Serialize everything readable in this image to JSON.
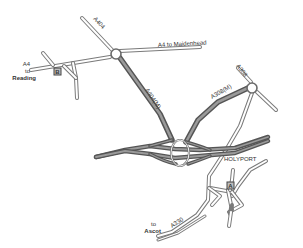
{
  "map": {
    "colors": {
      "background": "#ffffff",
      "road_outline": "#7a7a7a",
      "road_fill": "#ffffff",
      "motorway_outline": "#5a5a5a",
      "motorway_fill": "#8c8c8c",
      "label": "#333333",
      "marker_border": "#444444",
      "marker_fill": "#bdbdbd"
    },
    "roads": {
      "a404": "A404",
      "a404m": "A404(M)",
      "a308m": "A308(M)",
      "a308": "A308",
      "a330": "A330",
      "a4_east": "A4 to Maidenhead"
    },
    "destinations": {
      "reading_road": "A4",
      "reading_to": "to",
      "reading_name": "Reading",
      "ascot_to": "to",
      "ascot_name": "Ascot"
    },
    "places": {
      "holyport": "HOLYPORT"
    },
    "markers": {
      "b": "B",
      "a": "A"
    }
  }
}
